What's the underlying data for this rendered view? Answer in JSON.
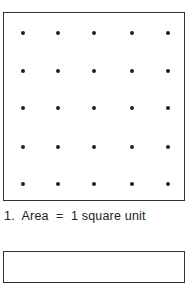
{
  "figure": {
    "grid": {
      "rows": 5,
      "cols": 5,
      "dot_color": "#222222",
      "border_color": "#333333",
      "col_positions": [
        19,
        54,
        90,
        128,
        164
      ],
      "row_positions": [
        20,
        58,
        95,
        134,
        171
      ]
    },
    "caption": {
      "number": "1.",
      "text": "Area = 1 square unit",
      "full": "1.  Area  =  1 square unit"
    }
  }
}
